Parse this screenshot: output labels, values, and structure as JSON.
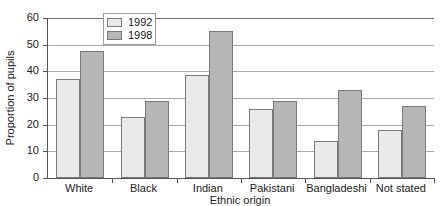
{
  "chart_data": {
    "type": "bar",
    "title": "",
    "xlabel": "Ethnic origin",
    "ylabel": "Proportion of pupils",
    "categories": [
      "White",
      "Black",
      "Indian",
      "Pakistani",
      "Bangladeshi",
      "Not stated"
    ],
    "series": [
      {
        "name": "1992",
        "color": "#e9e9e9",
        "values": [
          37,
          23,
          38.5,
          26,
          14,
          18
        ]
      },
      {
        "name": "1998",
        "color": "#b6b6b6",
        "values": [
          47.5,
          29,
          55,
          29,
          33,
          27
        ]
      }
    ],
    "ylim": [
      0,
      60
    ],
    "yticks": [
      0,
      10,
      20,
      30,
      40,
      50,
      60
    ],
    "ytick_labels": [
      "0",
      "10",
      "20",
      "30",
      "40",
      "50",
      "60"
    ],
    "grid": true,
    "grid_axis": "y",
    "legend_position": "top-center",
    "legend": [
      "1992",
      "1998"
    ]
  }
}
